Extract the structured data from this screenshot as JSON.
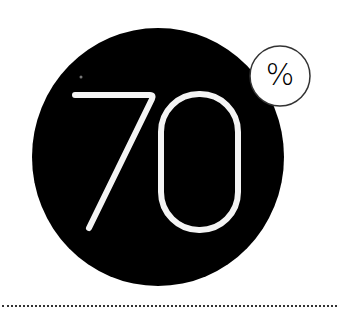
{
  "graphic": {
    "value": "70",
    "unit": "%",
    "colors": {
      "circle_fill": "#000000",
      "number_stroke": "#ffffff",
      "badge_fill": "#ffffff",
      "badge_stroke": "#333333",
      "background": "#ffffff",
      "divider": "#333333"
    }
  }
}
